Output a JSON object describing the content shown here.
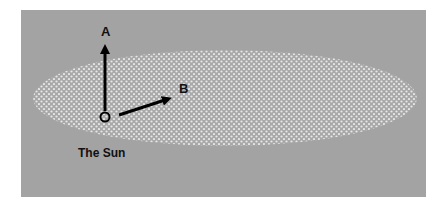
{
  "diagram": {
    "background_color": "#a3a3a3",
    "ellipse_fill": "#b8b8b8",
    "dot_color": "#e6e6e6",
    "origin_label": "O",
    "arrow_a_label": "A",
    "arrow_b_label": "B",
    "caption": "The Sun"
  }
}
